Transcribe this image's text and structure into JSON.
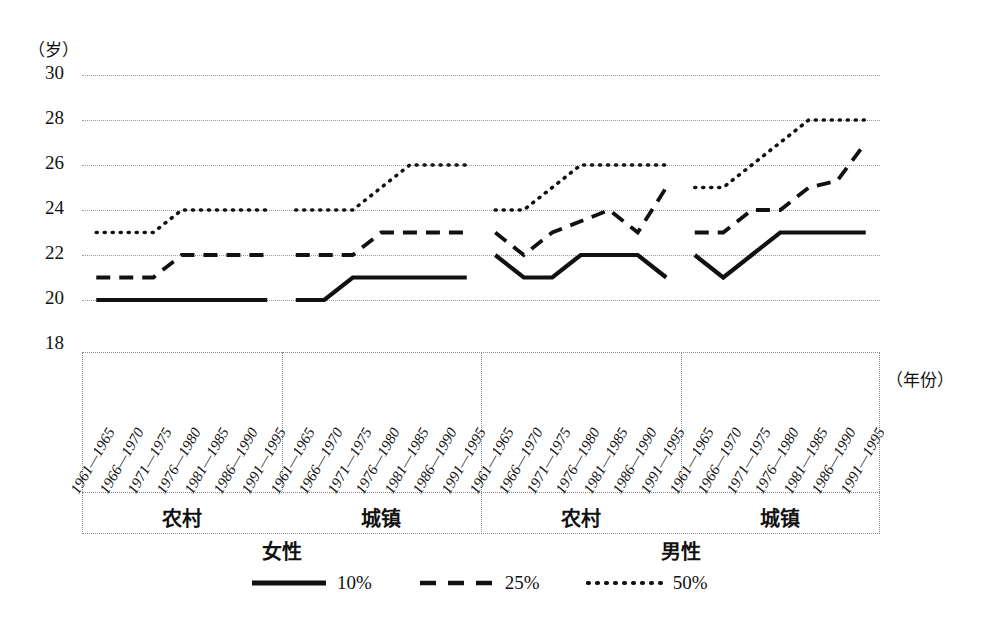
{
  "axis": {
    "y_unit": "（岁）",
    "y_ticks": [
      "30",
      "28",
      "26",
      "24",
      "22",
      "20",
      "18"
    ],
    "x_title": "（年份）"
  },
  "categories": [
    "1961—1965",
    "1966—1970",
    "1971—1975",
    "1976—1980",
    "1981—1985",
    "1986—1990",
    "1991—1995"
  ],
  "groups": [
    {
      "sex": "女性",
      "area": "农村"
    },
    {
      "sex": "女性",
      "area": "城镇"
    },
    {
      "sex": "男性",
      "area": "农村"
    },
    {
      "sex": "男性",
      "area": "城镇"
    }
  ],
  "sex_labels": [
    "女性",
    "男性"
  ],
  "legend": [
    {
      "label": "10%",
      "style": "solid"
    },
    {
      "label": "25%",
      "style": "dashed"
    },
    {
      "label": "50%",
      "style": "dotted"
    }
  ],
  "chart_data": {
    "type": "line",
    "title": "",
    "xlabel": "（年份）",
    "ylabel": "（岁）",
    "ylim": [
      18,
      30
    ],
    "ytick_step": 2,
    "grid": true,
    "legend_position": "bottom",
    "x": [
      "1961—1965",
      "1966—1970",
      "1971—1975",
      "1976—1980",
      "1981—1985",
      "1986—1990",
      "1991—1995"
    ],
    "panels": [
      {
        "sex": "女性",
        "area": "农村",
        "series": [
          {
            "name": "10%",
            "style": "solid",
            "values": [
              20,
              20,
              20,
              20,
              20,
              20,
              20
            ]
          },
          {
            "name": "25%",
            "style": "dashed",
            "values": [
              21,
              21,
              21,
              22,
              22,
              22,
              22
            ]
          },
          {
            "name": "50%",
            "style": "dotted",
            "values": [
              23,
              23,
              23,
              24,
              24,
              24,
              24
            ]
          }
        ]
      },
      {
        "sex": "女性",
        "area": "城镇",
        "series": [
          {
            "name": "10%",
            "style": "solid",
            "values": [
              20,
              20,
              21,
              21,
              21,
              21,
              21
            ]
          },
          {
            "name": "25%",
            "style": "dashed",
            "values": [
              22,
              22,
              22,
              23,
              23,
              23,
              23
            ]
          },
          {
            "name": "50%",
            "style": "dotted",
            "values": [
              24,
              24,
              24,
              25,
              26,
              26,
              26
            ]
          }
        ]
      },
      {
        "sex": "男性",
        "area": "农村",
        "series": [
          {
            "name": "10%",
            "style": "solid",
            "values": [
              22,
              21,
              21,
              22,
              22,
              22,
              21
            ]
          },
          {
            "name": "25%",
            "style": "dashed",
            "values": [
              23,
              22,
              23,
              23.5,
              24,
              23,
              25
            ]
          },
          {
            "name": "50%",
            "style": "dotted",
            "values": [
              24,
              24,
              25,
              26,
              26,
              26,
              26
            ]
          }
        ]
      },
      {
        "sex": "男性",
        "area": "城镇",
        "series": [
          {
            "name": "10%",
            "style": "solid",
            "values": [
              22,
              21,
              22,
              23,
              23,
              23,
              23
            ]
          },
          {
            "name": "25%",
            "style": "dashed",
            "values": [
              23,
              23,
              24,
              24,
              25,
              25.3,
              27
            ]
          },
          {
            "name": "50%",
            "style": "dotted",
            "values": [
              25,
              25,
              26,
              27,
              28,
              28,
              28
            ]
          }
        ]
      }
    ]
  },
  "colors": {
    "ink": "#111111",
    "grid": "#9a9a9a",
    "background": "#ffffff"
  }
}
